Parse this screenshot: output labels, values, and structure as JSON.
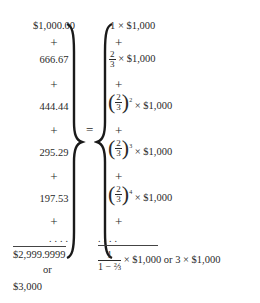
{
  "left_series": {
    "terms": [
      "$1,000.00",
      "666.67",
      "444.44",
      "295.29",
      "197.53"
    ],
    "plus": "+",
    "dots": "....",
    "total": "$2,999.9999",
    "or_label": "or",
    "rounded_total": "$3,000"
  },
  "equals": "=",
  "right_series": {
    "multiplier": "× $1,000",
    "term1_coef": "1",
    "fraction_num": "2",
    "fraction_den": "3",
    "exponents": [
      "2",
      "3",
      "4"
    ],
    "plus": "+",
    "dots": "....",
    "result_num": "1",
    "result_den": "1 − ⅔",
    "result_tail": "× $1,000 or 3 × $1,000"
  }
}
